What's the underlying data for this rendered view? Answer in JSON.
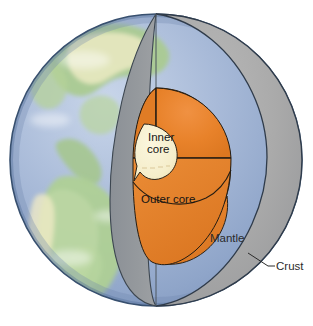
{
  "figure": {
    "view": "cutaway sphere with wedge removed",
    "background_color": "#ffffff"
  },
  "labels": {
    "inner_core_line1": "Inner",
    "inner_core_line2": "core",
    "outer_core": "Outer core",
    "mantle": "Mantle",
    "crust": "Crust"
  },
  "layers": [
    {
      "name": "Crust",
      "label": "Crust",
      "color": "#4a5568",
      "description": "thin dark outline at sphere surface",
      "callout": true
    },
    {
      "name": "Mantle",
      "label": "Mantle",
      "color": "#a9a9a9",
      "cut_face_color": "#8f9296",
      "description": "grey region between crust and outer core"
    },
    {
      "name": "Outer core",
      "label": "Outer core",
      "color": "#e8822a",
      "shade_color": "#d9731f",
      "description": "orange sphere beneath the mantle"
    },
    {
      "name": "Inner core",
      "label": "Inner core",
      "color": "#f7efcf",
      "description": "pale cream innermost sphere"
    }
  ],
  "globe": {
    "ocean_color": "#9aaed2",
    "land_color": "#a9cb8f",
    "highland_color": "#ecebc4",
    "outline_color": "#38506f",
    "continents": [
      "North America",
      "South America"
    ]
  },
  "callout": {
    "crust_leader_line": "line from sphere edge to Crust label"
  }
}
